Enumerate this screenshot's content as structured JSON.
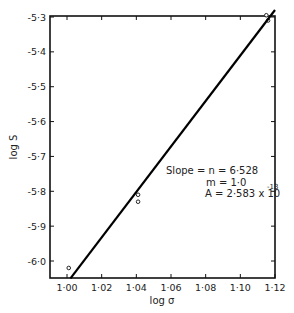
{
  "chart_data": {
    "type": "scatter",
    "title": "",
    "xlabel": "log σ",
    "ylabel": "log S",
    "xlim": [
      0.99,
      1.12
    ],
    "ylim": [
      -6.05,
      -5.28
    ],
    "x_ticks": [
      "1·00",
      "1·02",
      "1·04",
      "1·06",
      "1·08",
      "1·10",
      "1·12"
    ],
    "y_ticks": [
      "-5·3",
      "-5·4",
      "-5·5",
      "-5·6",
      "-5·7",
      "-5·8",
      "-5·9",
      "-6·0"
    ],
    "grid": false,
    "series": [
      {
        "name": "data points",
        "marker": "open circle",
        "x": [
          1.001,
          1.041,
          1.041,
          1.115,
          1.116
        ],
        "y": [
          -6.02,
          -5.81,
          -5.83,
          -5.295,
          -5.31
        ]
      },
      {
        "name": "fit line",
        "type": "line",
        "x": [
          1.002,
          1.12
        ],
        "y": [
          -6.05,
          -5.28
        ]
      }
    ],
    "annotations": [
      "Slope = n = 6·528",
      "m = 1·0",
      "A = 2·583 x 10^-13"
    ]
  },
  "labels": {
    "xlabel": "log σ",
    "ylabel": "log S",
    "ann1": "Slope = n = 6·528",
    "ann2": "m = 1·0",
    "ann3_base": "A = 2·583 x 10",
    "ann3_exp": "-13"
  }
}
